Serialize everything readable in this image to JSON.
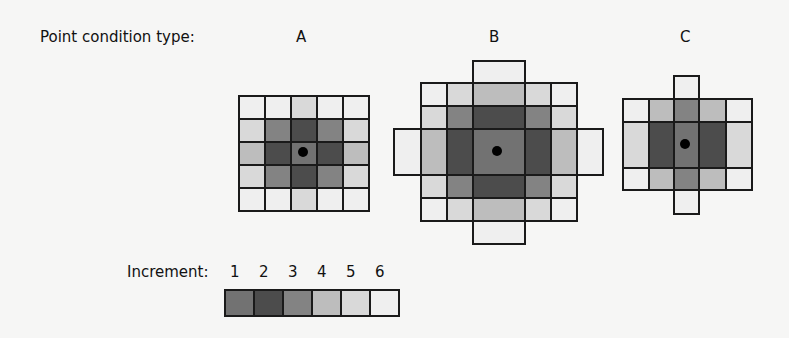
{
  "title": "Point condition type:",
  "types": [
    "A",
    "B",
    "C"
  ],
  "legend": {
    "title": "Increment:",
    "increments": [
      "1",
      "2",
      "3",
      "4",
      "5",
      "6"
    ]
  },
  "colors": {
    "1": "#727272",
    "2": "#4c4c4c",
    "3": "#838383",
    "4": "#bdbdbd",
    "5": "#d9d9d9",
    "6": "#efefef",
    "border": "#1a1a1a"
  },
  "grids": {
    "A": {
      "center": [
        303,
        152
      ],
      "cells": [
        [
          238,
          95,
          26,
          23,
          6
        ],
        [
          264,
          95,
          26,
          23,
          6
        ],
        [
          290,
          95,
          26,
          23,
          5
        ],
        [
          316,
          95,
          26,
          23,
          6
        ],
        [
          342,
          95,
          26,
          23,
          6
        ],
        [
          238,
          118,
          26,
          23,
          5
        ],
        [
          264,
          118,
          26,
          23,
          3
        ],
        [
          290,
          118,
          26,
          23,
          2
        ],
        [
          316,
          118,
          26,
          23,
          3
        ],
        [
          342,
          118,
          26,
          23,
          5
        ],
        [
          238,
          141,
          26,
          23,
          4
        ],
        [
          264,
          141,
          26,
          23,
          2
        ],
        [
          290,
          141,
          26,
          23,
          1
        ],
        [
          316,
          141,
          26,
          23,
          2
        ],
        [
          342,
          141,
          26,
          23,
          4
        ],
        [
          238,
          164,
          26,
          23,
          5
        ],
        [
          264,
          164,
          26,
          23,
          3
        ],
        [
          290,
          164,
          26,
          23,
          2
        ],
        [
          316,
          164,
          26,
          23,
          3
        ],
        [
          342,
          164,
          26,
          23,
          5
        ],
        [
          238,
          187,
          26,
          23,
          6
        ],
        [
          264,
          187,
          26,
          23,
          6
        ],
        [
          290,
          187,
          26,
          23,
          5
        ],
        [
          316,
          187,
          26,
          23,
          6
        ],
        [
          342,
          187,
          26,
          23,
          6
        ]
      ]
    },
    "B": {
      "center": [
        497,
        151
      ],
      "cells": [
        [
          472,
          60,
          52,
          23,
          6
        ],
        [
          420,
          82,
          26,
          23,
          6
        ],
        [
          446,
          82,
          26,
          23,
          5
        ],
        [
          472,
          82,
          52,
          23,
          4
        ],
        [
          524,
          82,
          26,
          23,
          5
        ],
        [
          550,
          82,
          26,
          23,
          6
        ],
        [
          420,
          105,
          26,
          23,
          5
        ],
        [
          446,
          105,
          26,
          23,
          3
        ],
        [
          472,
          105,
          52,
          23,
          2
        ],
        [
          524,
          105,
          26,
          23,
          3
        ],
        [
          550,
          105,
          26,
          23,
          5
        ],
        [
          393,
          128,
          27,
          46,
          6
        ],
        [
          420,
          128,
          26,
          46,
          4
        ],
        [
          446,
          128,
          26,
          46,
          2
        ],
        [
          472,
          128,
          52,
          46,
          1
        ],
        [
          524,
          128,
          26,
          46,
          2
        ],
        [
          550,
          128,
          26,
          46,
          4
        ],
        [
          576,
          128,
          26,
          46,
          6
        ],
        [
          420,
          174,
          26,
          23,
          5
        ],
        [
          446,
          174,
          26,
          23,
          3
        ],
        [
          472,
          174,
          52,
          23,
          2
        ],
        [
          524,
          174,
          26,
          23,
          3
        ],
        [
          550,
          174,
          26,
          23,
          5
        ],
        [
          420,
          197,
          26,
          23,
          6
        ],
        [
          446,
          197,
          26,
          23,
          5
        ],
        [
          472,
          197,
          52,
          23,
          4
        ],
        [
          524,
          197,
          26,
          23,
          5
        ],
        [
          550,
          197,
          26,
          23,
          6
        ],
        [
          472,
          220,
          52,
          23,
          6
        ]
      ]
    },
    "C": {
      "center": [
        685,
        144
      ],
      "cells": [
        [
          673,
          75,
          25,
          23,
          6
        ],
        [
          622,
          98,
          26,
          23,
          6
        ],
        [
          648,
          98,
          25,
          23,
          4
        ],
        [
          673,
          98,
          25,
          23,
          3
        ],
        [
          698,
          98,
          27,
          23,
          4
        ],
        [
          725,
          98,
          26,
          23,
          6
        ],
        [
          622,
          121,
          26,
          46,
          5
        ],
        [
          648,
          121,
          25,
          46,
          2
        ],
        [
          673,
          121,
          25,
          46,
          1
        ],
        [
          698,
          121,
          27,
          46,
          2
        ],
        [
          725,
          121,
          26,
          46,
          5
        ],
        [
          622,
          167,
          26,
          22,
          6
        ],
        [
          648,
          167,
          25,
          22,
          4
        ],
        [
          673,
          167,
          25,
          22,
          3
        ],
        [
          698,
          167,
          27,
          22,
          4
        ],
        [
          725,
          167,
          26,
          22,
          6
        ],
        [
          673,
          189,
          25,
          24,
          6
        ]
      ]
    }
  }
}
